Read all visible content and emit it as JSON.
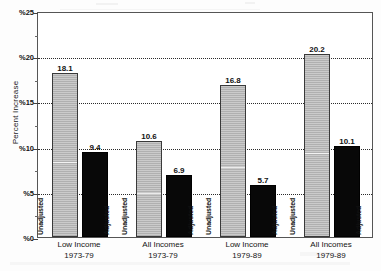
{
  "chart_data": {
    "type": "bar",
    "title": "",
    "subtitle": "",
    "xlabel": "",
    "ylabel": "Percent Increase",
    "ylim": [
      0,
      25
    ],
    "ytick_labels": [
      "%0",
      "%5",
      "%10",
      "%15",
      "%20",
      "%25"
    ],
    "ytick_values": [
      0,
      5,
      10,
      15,
      20,
      25
    ],
    "yminor_values": [
      2.5,
      7.5,
      12.5,
      17.5,
      22.5
    ],
    "grid": "horizontal-dotted",
    "legend_position": "in-bar-rotated-labels",
    "categories": [
      "Low Income\n1973-79",
      "All Incomes\n1973-79",
      "Low Income\n1979-89",
      "All Incomes\n1979-89"
    ],
    "category_lines": [
      {
        "line1": "Low Income",
        "line2": "1973-79"
      },
      {
        "line1": "All Incomes",
        "line2": "1973-79"
      },
      {
        "line1": "Low Income",
        "line2": "1979-89"
      },
      {
        "line1": "All Incomes",
        "line2": "1979-89"
      }
    ],
    "series": [
      {
        "name": "Unadjusted",
        "color": "#b7b7b7",
        "values": [
          18.1,
          16.8,
          20.2,
          10.6
        ],
        "values_ordered": [
          18.1,
          10.6,
          16.8,
          20.2
        ]
      },
      {
        "name": "Adjusted",
        "color": "#080808",
        "values_ordered": [
          9.4,
          6.9,
          5.7,
          10.1
        ]
      }
    ],
    "bars": [
      {
        "group": 0,
        "series": "Unadjusted",
        "value": 18.1,
        "value_label": "18.1",
        "caption": "Unadjusted"
      },
      {
        "group": 0,
        "series": "Adjusted",
        "value": 9.4,
        "value_label": "9.4",
        "caption": "Adjusted"
      },
      {
        "group": 1,
        "series": "Unadjusted",
        "value": 10.6,
        "value_label": "10.6",
        "caption": "Unadjusted"
      },
      {
        "group": 1,
        "series": "Adjusted",
        "value": 6.9,
        "value_label": "6.9",
        "caption": "Adjusted"
      },
      {
        "group": 2,
        "series": "Unadjusted",
        "value": 16.8,
        "value_label": "16.8",
        "caption": "Unadjusted"
      },
      {
        "group": 2,
        "series": "Adjusted",
        "value": 5.7,
        "value_label": "5.7",
        "caption": "Adjusted"
      },
      {
        "group": 3,
        "series": "Unadjusted",
        "value": 20.2,
        "value_label": "20.2",
        "caption": "Unadjusted"
      },
      {
        "group": 3,
        "series": "Adjusted",
        "value": 10.1,
        "value_label": "10.1",
        "caption": "Adjusted"
      }
    ]
  },
  "axis": {
    "y_title": "Percent Increase",
    "ticks": [
      {
        "label": "%25",
        "value": 25
      },
      {
        "label": "%20",
        "value": 20
      },
      {
        "label": "%15",
        "value": 15
      },
      {
        "label": "%10",
        "value": 10
      },
      {
        "label": "%5",
        "value": 5
      },
      {
        "label": "%0",
        "value": 0
      }
    ]
  },
  "colors": {
    "unadjusted_bar": "#b7b7b7",
    "adjusted_bar": "#080808",
    "grid": "#2b2b2b",
    "frame": "#555555",
    "text": "#141414",
    "background": "#fdfdfd"
  }
}
